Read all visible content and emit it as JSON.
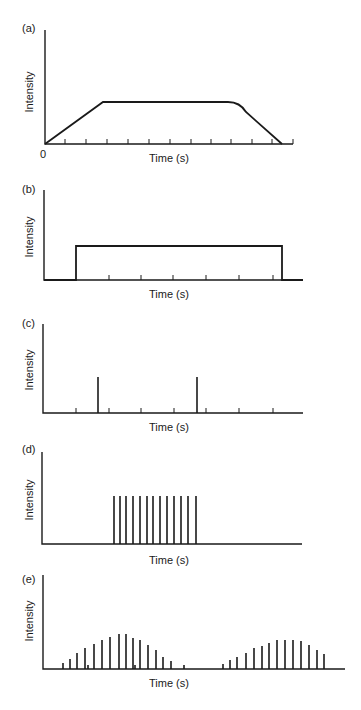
{
  "chart_data": [
    {
      "id": "a",
      "panel_label": "(a)",
      "type": "line",
      "title": "",
      "xlabel": "Time (s)",
      "ylabel": "Intensity",
      "origin_label": "0",
      "description": "Ramp up, plateau, ramp down (trapezoid with rounded shoulder)",
      "x": [
        0,
        2.8,
        9,
        9.6,
        11.6
      ],
      "values": [
        0,
        1,
        1,
        0.92,
        0
      ],
      "xlim": [
        0,
        12
      ],
      "x_ticks": [
        1,
        2,
        3,
        4,
        5,
        6,
        7,
        8,
        9,
        10,
        11,
        12
      ],
      "grid": false,
      "frame": {
        "axis_x": 45,
        "axis_top": 30,
        "baseline": 144,
        "axis_end": 293,
        "label_x": 22,
        "label_y": 32,
        "ytitle_x": 33,
        "ytitle_y": 92,
        "xtitle_y": 162,
        "xtitle_x": 169,
        "path": [
          [
            45,
            144
          ],
          [
            103,
            102
          ],
          [
            228,
            102
          ],
          [
            240,
            108
          ],
          [
            282,
            144
          ]
        ],
        "ticks": [
          65,
          86,
          107,
          128,
          149,
          170,
          191,
          211,
          231,
          252,
          272,
          293
        ]
      }
    },
    {
      "id": "b",
      "panel_label": "(b)",
      "type": "line",
      "title": "",
      "xlabel": "Time (s)",
      "ylabel": "Intensity",
      "description": "Rectangular pulse (continuous constant intensity)",
      "x": [
        0,
        1,
        1,
        7.2,
        7.2,
        8
      ],
      "values": [
        0,
        0,
        1,
        1,
        0,
        0
      ],
      "x_ticks": [
        1,
        2,
        3,
        4,
        5,
        6,
        7
      ],
      "grid": false,
      "frame": {
        "axis_x": 44,
        "axis_top": 190,
        "baseline": 280,
        "axis_end": 303,
        "label_x": 22,
        "label_y": 193,
        "ytitle_x": 33,
        "ytitle_y": 237,
        "xtitle_y": 298,
        "xtitle_x": 169,
        "path": [
          [
            44,
            280
          ],
          [
            76,
            280
          ],
          [
            76,
            246
          ],
          [
            282,
            246
          ],
          [
            282,
            280
          ],
          [
            303,
            280
          ]
        ],
        "ticks": [
          109,
          141,
          173,
          206,
          239,
          273
        ]
      }
    },
    {
      "id": "c",
      "panel_label": "(c)",
      "type": "bar",
      "title": "",
      "xlabel": "Time (s)",
      "ylabel": "Intensity",
      "description": "Two isolated single pulses",
      "x": [
        1.7,
        4.7
      ],
      "values": [
        1,
        1
      ],
      "x_ticks": [
        1,
        2,
        3,
        4,
        5,
        6,
        7
      ],
      "grid": false,
      "frame": {
        "axis_x": 43,
        "axis_top": 324,
        "baseline": 413,
        "axis_end": 303,
        "label_x": 22,
        "label_y": 327,
        "ytitle_x": 33,
        "ytitle_y": 370,
        "xtitle_y": 431,
        "xtitle_x": 169,
        "bars": [
          [
            98,
            36
          ],
          [
            197,
            36
          ]
        ],
        "ticks": [
          76,
          109,
          141,
          174,
          206,
          239,
          273
        ]
      }
    },
    {
      "id": "d",
      "panel_label": "(d)",
      "type": "bar",
      "title": "",
      "xlabel": "Time (s)",
      "ylabel": "Intensity",
      "description": "Train of 13 equal-intensity pulses",
      "x": [
        1,
        2,
        3,
        4,
        5,
        6,
        7,
        8,
        9,
        10,
        11,
        12,
        13
      ],
      "values": [
        1,
        1,
        1,
        1,
        1,
        1,
        1,
        1,
        1,
        1,
        1,
        1,
        1
      ],
      "x_ticks": [],
      "grid": false,
      "frame": {
        "axis_x": 42,
        "axis_top": 452,
        "baseline": 544,
        "axis_end": 302,
        "label_x": 22,
        "label_y": 453,
        "ytitle_x": 33,
        "ytitle_y": 500,
        "xtitle_y": 564,
        "xtitle_x": 169,
        "bars": [
          [
            114,
            48
          ],
          [
            120,
            48
          ],
          [
            126,
            48
          ],
          [
            133,
            48
          ],
          [
            140,
            48
          ],
          [
            147,
            48
          ],
          [
            153,
            48
          ],
          [
            160,
            48
          ],
          [
            167,
            48
          ],
          [
            174,
            48
          ],
          [
            181,
            48
          ],
          [
            188,
            48
          ],
          [
            196,
            48
          ]
        ],
        "ticks": []
      }
    },
    {
      "id": "e",
      "panel_label": "(e)",
      "type": "bar",
      "title": "",
      "xlabel": "Time (s)",
      "ylabel": "Intensity",
      "description": "Two bursts of pulses with rising and falling intensity envelopes",
      "series": [
        {
          "name": "burst 1",
          "x_px": [
            63,
            70,
            77,
            85,
            88,
            94,
            102,
            110,
            119,
            126,
            133,
            135,
            140,
            148,
            156,
            163,
            171,
            184
          ],
          "values": [
            6,
            10,
            16,
            21,
            4,
            25,
            29,
            32,
            35,
            35,
            31,
            4,
            29,
            24,
            19,
            12,
            8,
            4
          ]
        },
        {
          "name": "burst 2",
          "x_px": [
            223,
            230,
            237,
            246,
            254,
            262,
            269,
            277,
            285,
            293,
            301,
            309,
            317,
            324
          ],
          "values": [
            5,
            9,
            12,
            16,
            21,
            23,
            26,
            29,
            29,
            29,
            28,
            24,
            19,
            15
          ]
        }
      ],
      "x_ticks": [],
      "grid": false,
      "frame": {
        "axis_x": 43,
        "axis_top": 575,
        "baseline": 669,
        "axis_end": 345,
        "label_x": 22,
        "label_y": 583,
        "ytitle_x": 33,
        "ytitle_y": 621,
        "xtitle_y": 687,
        "xtitle_x": 169,
        "ticks": []
      }
    }
  ]
}
